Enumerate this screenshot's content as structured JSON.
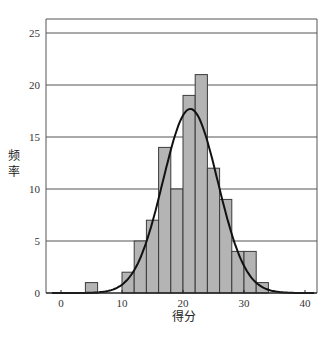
{
  "chart_data": {
    "type": "bar",
    "subtype": "histogram_with_normal_curve",
    "title": "",
    "xlabel": "得分",
    "ylabel": "频率",
    "xlim": [
      -2,
      42
    ],
    "ylim": [
      0,
      26
    ],
    "x_ticks": [
      0,
      10,
      20,
      30,
      40
    ],
    "y_ticks": [
      0,
      5,
      10,
      15,
      20,
      25
    ],
    "grid": {
      "horizontal": true,
      "vertical": false
    },
    "bin_width": 2,
    "bins": [
      {
        "start": 4,
        "end": 6,
        "count": 1
      },
      {
        "start": 10,
        "end": 12,
        "count": 2
      },
      {
        "start": 12,
        "end": 14,
        "count": 5
      },
      {
        "start": 14,
        "end": 16,
        "count": 7
      },
      {
        "start": 16,
        "end": 18,
        "count": 14
      },
      {
        "start": 18,
        "end": 20,
        "count": 10
      },
      {
        "start": 20,
        "end": 22,
        "count": 19
      },
      {
        "start": 22,
        "end": 24,
        "count": 21
      },
      {
        "start": 24,
        "end": 26,
        "count": 12
      },
      {
        "start": 26,
        "end": 28,
        "count": 9
      },
      {
        "start": 28,
        "end": 30,
        "count": 4
      },
      {
        "start": 30,
        "end": 32,
        "count": 4
      },
      {
        "start": 32,
        "end": 34,
        "count": 1
      }
    ],
    "categories": [
      "4-6",
      "10-12",
      "12-14",
      "14-16",
      "16-18",
      "18-20",
      "20-22",
      "22-24",
      "24-26",
      "26-28",
      "28-30",
      "30-32",
      "32-34"
    ],
    "values": [
      1,
      2,
      5,
      7,
      14,
      10,
      19,
      21,
      12,
      9,
      4,
      4,
      1
    ],
    "normal_curve": {
      "mean": 21.2,
      "sd": 4.5,
      "peak": 17.7
    },
    "colors": {
      "bar_fill": "#b4b4b4",
      "bar_edge": "#3a3a3a",
      "curve": "#111111",
      "grid": "#555555"
    }
  }
}
